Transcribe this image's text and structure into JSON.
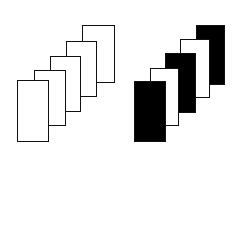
{
  "diagram": {
    "groups": [
      {
        "name": "outlined-stack",
        "cards": [
          {
            "x": 82,
            "y": 25,
            "w": 33,
            "h": 58,
            "fill": "#ffffff"
          },
          {
            "x": 66,
            "y": 41,
            "w": 31,
            "h": 56,
            "fill": "#ffffff"
          },
          {
            "x": 50,
            "y": 56,
            "w": 31,
            "h": 56,
            "fill": "#ffffff"
          },
          {
            "x": 34,
            "y": 70,
            "w": 32,
            "h": 56,
            "fill": "#ffffff"
          },
          {
            "x": 17,
            "y": 80,
            "w": 32,
            "h": 62,
            "fill": "#ffffff"
          }
        ]
      },
      {
        "name": "alternating-stack",
        "cards": [
          {
            "x": 196,
            "y": 25,
            "w": 29,
            "h": 60,
            "fill": "#000000"
          },
          {
            "x": 180,
            "y": 39,
            "w": 30,
            "h": 59,
            "fill": "#ffffff"
          },
          {
            "x": 165,
            "y": 53,
            "w": 31,
            "h": 60,
            "fill": "#000000"
          },
          {
            "x": 150,
            "y": 68,
            "w": 29,
            "h": 58,
            "fill": "#ffffff"
          },
          {
            "x": 134,
            "y": 81,
            "w": 32,
            "h": 61,
            "fill": "#000000"
          }
        ]
      }
    ]
  }
}
